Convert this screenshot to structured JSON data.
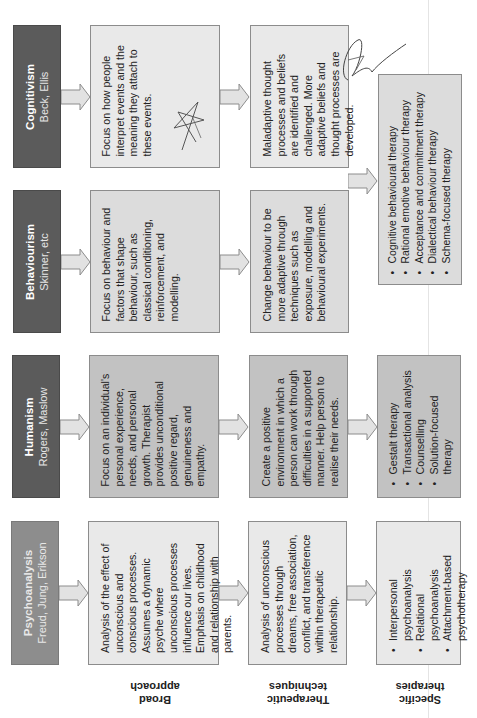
{
  "diagram": {
    "orientation": "rotated -90deg (text reads bottom-to-top)",
    "columns": {
      "broad_approach": "Broad approach",
      "therapeutic_techniques": "Therapeutic techniques",
      "specific_therapies": "Specific therapies"
    },
    "column_labels": {
      "broad": [
        "Broad",
        "approach"
      ],
      "techniques": [
        "Therapeutic",
        "techniques"
      ],
      "therapies": [
        "Specific",
        "therapies"
      ]
    },
    "rows": {
      "cognitivism": {
        "title": "Cognitivism",
        "theorists": "Beck, Ellis",
        "broad": "Focus on how people interpret events and the meaning they attach to these events.",
        "techniques": "Maladaptive thought processes and beliefs are identified and challenged. More adaptive beliefs and thought processes are developed."
      },
      "behaviourism": {
        "title": "Behaviourism",
        "theorists": "Skinner, etc",
        "broad": "Focus on behaviour and factors that shape behaviour, such as classical conditioning, reinforcement, and modelling.",
        "techniques": "Change behaviour to be more adaptive through techniques such as exposure, modelling and behavioural experiments."
      },
      "humanism": {
        "title": "Humanism",
        "theorists": "Rogers, Maslow",
        "broad": "Focus on an individual's personal experience, needs, and personal growth. Therapist provides unconditional positive regard, genuineness and empathy.",
        "techniques": "Create a positive environment in which a person can work through difficulties in a supported manner. Help person to realise their needs.",
        "therapies": [
          "Gestalt therapy",
          "Transactional analysis",
          "Counselling",
          "Solution-focused therapy"
        ]
      },
      "psychoanalysis": {
        "title": "Psychoanalysis",
        "theorists": "Freud, Jung, Erikson",
        "broad": "Analysis of the effect of unconscious and conscious processes. Assumes a dynamic psyche where unconscious processes influence our lives. Emphasis on childhood and relationship with parents.",
        "techniques": "Analysis of unconscious processes through dreams, free association, conflict, and transference within therapeutic relationship.",
        "therapies": [
          "Interpersonal psychoanalysis",
          "Relational psychoanalysis",
          "Attachment-based psychotherapy"
        ]
      }
    },
    "shared_therapies_cognitive_behavioural": [
      "Cognitive behavioural therapy",
      "Rational emotive behaviour therapy",
      "Acceptance and commitment therapy",
      "Dialectical behaviour therapy",
      "Schema-focused therapy"
    ],
    "colors": {
      "header_dark": "#5b5b5b",
      "header_light": "#8d8d8d",
      "box_light": "#e9e9e9",
      "box_mid": "#dcdcdc",
      "box_dark": "#c2c2c2",
      "border": "#8c8c8c"
    }
  }
}
